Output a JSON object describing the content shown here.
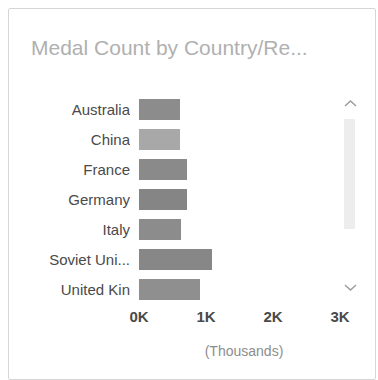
{
  "card": {
    "title": "Medal Count by Country/Re...",
    "accent_color": "#8c8c8c",
    "border_color": "#d6d6d6",
    "title_color": "#b0b0b0"
  },
  "scrollbar": {
    "up_icon": "chevron-up-icon",
    "down_icon": "chevron-down-icon",
    "thumb_color": "#ededed"
  },
  "chart_data": {
    "type": "bar",
    "orientation": "horizontal",
    "title": "Medal Count by Country/Re...",
    "xlabel": "(Thousands)",
    "ylabel": "",
    "categories": [
      "Australia",
      "China",
      "France",
      "Germany",
      "Italy",
      "Soviet Uni...",
      "United Kin"
    ],
    "values": [
      610,
      610,
      715,
      715,
      630,
      1090,
      910
    ],
    "bar_colors": [
      "#8c8c8c",
      "#a8a8a8",
      "#8a8a8a",
      "#858585",
      "#8c8c8c",
      "#878787",
      "#8f8f8f"
    ],
    "xlim": [
      0,
      3000
    ],
    "xticks": [
      0,
      1000,
      2000,
      3000
    ],
    "xticklabels": [
      "0K",
      "1K",
      "2K",
      "3K"
    ],
    "grid": false,
    "legend": false
  }
}
